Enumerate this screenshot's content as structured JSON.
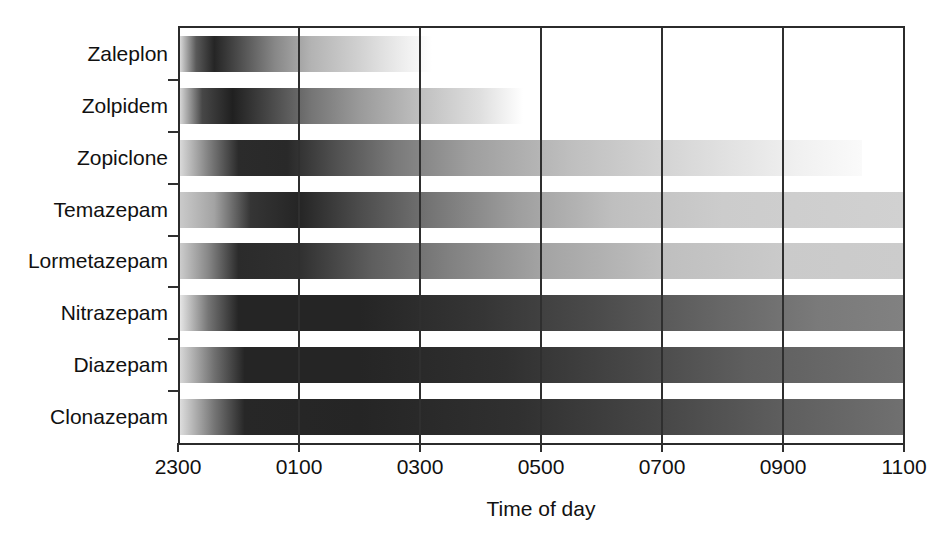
{
  "chart_data": {
    "type": "bar",
    "title": "",
    "subtitle": "",
    "xlabel": "Time of day",
    "ylabel": "",
    "orientation": "horizontal",
    "grid": "vertical-only",
    "legend": "none",
    "xlim": [
      2300,
      1100
    ],
    "x_axis_hours": [
      23,
      35
    ],
    "xticks": [
      "2300",
      "0100",
      "0300",
      "0500",
      "0700",
      "0900",
      "1100"
    ],
    "xtick_hours": [
      23,
      25,
      27,
      29,
      31,
      33,
      35
    ],
    "categories": [
      "Zaleplon",
      "Zolpidem",
      "Zopiclone",
      "Temazepam",
      "Lormetazepam",
      "Nitrazepam",
      "Diazepam",
      "Clonazepam"
    ],
    "series": [
      {
        "name": "Zaleplon",
        "onset_hour": 23.0,
        "peak_hour": 23.7,
        "end_hour": 27.2,
        "stops": [
          {
            "hour": 23.0,
            "intensity": 0.1
          },
          {
            "hour": 23.3,
            "intensity": 0.72
          },
          {
            "hour": 23.6,
            "intensity": 0.95
          },
          {
            "hour": 24.0,
            "intensity": 0.78
          },
          {
            "hour": 24.6,
            "intensity": 0.52
          },
          {
            "hour": 25.2,
            "intensity": 0.33
          },
          {
            "hour": 26.0,
            "intensity": 0.2
          },
          {
            "hour": 26.7,
            "intensity": 0.08
          },
          {
            "hour": 27.2,
            "intensity": 0.0
          }
        ]
      },
      {
        "name": "Zolpidem",
        "onset_hour": 23.0,
        "peak_hour": 23.8,
        "end_hour": 28.7,
        "stops": [
          {
            "hour": 23.0,
            "intensity": 0.12
          },
          {
            "hour": 23.4,
            "intensity": 0.8
          },
          {
            "hour": 23.9,
            "intensity": 0.97
          },
          {
            "hour": 24.5,
            "intensity": 0.8
          },
          {
            "hour": 25.2,
            "intensity": 0.6
          },
          {
            "hour": 26.0,
            "intensity": 0.44
          },
          {
            "hour": 27.0,
            "intensity": 0.28
          },
          {
            "hour": 28.0,
            "intensity": 0.14
          },
          {
            "hour": 28.7,
            "intensity": 0.0
          }
        ]
      },
      {
        "name": "Zopiclone",
        "onset_hour": 23.0,
        "peak_hour": 24.3,
        "end_hour": 34.3,
        "stops": [
          {
            "hour": 23.0,
            "intensity": 0.14
          },
          {
            "hour": 23.5,
            "intensity": 0.55
          },
          {
            "hour": 24.0,
            "intensity": 0.92
          },
          {
            "hour": 24.8,
            "intensity": 0.93
          },
          {
            "hour": 25.6,
            "intensity": 0.76
          },
          {
            "hour": 26.6,
            "intensity": 0.58
          },
          {
            "hour": 27.8,
            "intensity": 0.42
          },
          {
            "hour": 29.5,
            "intensity": 0.28
          },
          {
            "hour": 31.5,
            "intensity": 0.16
          },
          {
            "hour": 33.3,
            "intensity": 0.06
          },
          {
            "hour": 34.3,
            "intensity": 0.02
          }
        ]
      },
      {
        "name": "Temazepam",
        "onset_hour": 23.0,
        "peak_hour": 24.6,
        "end_hour": 35.0,
        "stops": [
          {
            "hour": 23.0,
            "intensity": 0.22
          },
          {
            "hour": 23.6,
            "intensity": 0.4
          },
          {
            "hour": 24.2,
            "intensity": 0.88
          },
          {
            "hour": 25.0,
            "intensity": 0.95
          },
          {
            "hour": 26.0,
            "intensity": 0.78
          },
          {
            "hour": 27.2,
            "intensity": 0.6
          },
          {
            "hour": 28.6,
            "intensity": 0.42
          },
          {
            "hour": 30.2,
            "intensity": 0.28
          },
          {
            "hour": 32.0,
            "intensity": 0.22
          },
          {
            "hour": 35.0,
            "intensity": 0.2
          }
        ]
      },
      {
        "name": "Lormetazepam",
        "onset_hour": 23.0,
        "peak_hour": 24.2,
        "end_hour": 35.0,
        "stops": [
          {
            "hour": 23.0,
            "intensity": 0.2
          },
          {
            "hour": 23.5,
            "intensity": 0.52
          },
          {
            "hour": 24.0,
            "intensity": 0.92
          },
          {
            "hour": 25.0,
            "intensity": 0.9
          },
          {
            "hour": 26.2,
            "intensity": 0.7
          },
          {
            "hour": 27.5,
            "intensity": 0.55
          },
          {
            "hour": 29.0,
            "intensity": 0.4
          },
          {
            "hour": 31.0,
            "intensity": 0.28
          },
          {
            "hour": 33.0,
            "intensity": 0.23
          },
          {
            "hour": 35.0,
            "intensity": 0.22
          }
        ]
      },
      {
        "name": "Nitrazepam",
        "onset_hour": 23.0,
        "peak_hour": 24.5,
        "end_hour": 35.0,
        "stops": [
          {
            "hour": 23.0,
            "intensity": 0.08
          },
          {
            "hour": 23.5,
            "intensity": 0.6
          },
          {
            "hour": 24.0,
            "intensity": 0.95
          },
          {
            "hour": 26.0,
            "intensity": 0.95
          },
          {
            "hour": 28.0,
            "intensity": 0.88
          },
          {
            "hour": 30.0,
            "intensity": 0.78
          },
          {
            "hour": 32.0,
            "intensity": 0.66
          },
          {
            "hour": 33.6,
            "intensity": 0.58
          },
          {
            "hour": 35.0,
            "intensity": 0.55
          }
        ]
      },
      {
        "name": "Diazepam",
        "onset_hour": 23.0,
        "peak_hour": 24.5,
        "end_hour": 35.0,
        "stops": [
          {
            "hour": 23.0,
            "intensity": 0.15
          },
          {
            "hour": 23.6,
            "intensity": 0.62
          },
          {
            "hour": 24.1,
            "intensity": 0.95
          },
          {
            "hour": 26.0,
            "intensity": 0.95
          },
          {
            "hour": 28.4,
            "intensity": 0.9
          },
          {
            "hour": 30.5,
            "intensity": 0.8
          },
          {
            "hour": 32.4,
            "intensity": 0.7
          },
          {
            "hour": 35.0,
            "intensity": 0.62
          }
        ]
      },
      {
        "name": "Clonazepam",
        "onset_hour": 23.0,
        "peak_hour": 24.5,
        "end_hour": 35.0,
        "stops": [
          {
            "hour": 23.0,
            "intensity": 0.12
          },
          {
            "hour": 23.6,
            "intensity": 0.6
          },
          {
            "hour": 24.1,
            "intensity": 0.94
          },
          {
            "hour": 26.0,
            "intensity": 0.95
          },
          {
            "hour": 28.6,
            "intensity": 0.9
          },
          {
            "hour": 31.0,
            "intensity": 0.8
          },
          {
            "hour": 33.0,
            "intensity": 0.7
          },
          {
            "hour": 35.0,
            "intensity": 0.62
          }
        ]
      }
    ],
    "colors": {
      "ink": "#2f2f2f",
      "axis": "#2b2b2b",
      "bar_dark": "#1a1a1a",
      "bar_light": "#ffffff",
      "background": "#ffffff"
    }
  },
  "axis": {
    "x_title": "Time of day"
  }
}
